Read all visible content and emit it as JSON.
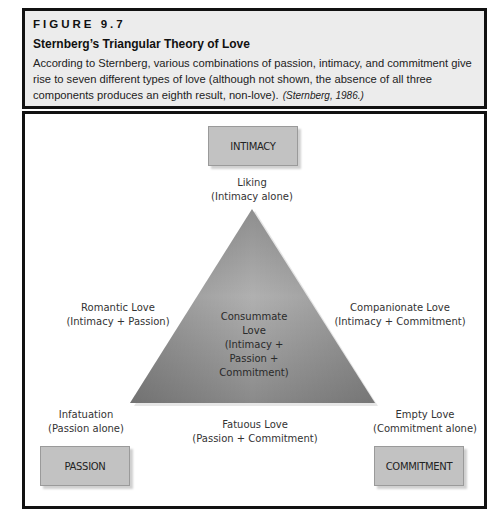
{
  "figure": {
    "label": "FIGURE 9.7",
    "title": "Sternberg’s Triangular Theory of Love",
    "caption": "According to Sternberg, various combinations of passion, intimacy, and commitment give rise to seven different types of love (although not shown, the absence of all three components produces an eighth result, non-love).",
    "citation": "(Sternberg, 1986.)"
  },
  "diagram": {
    "components": {
      "top": "INTIMACY",
      "bottom_left": "PASSION",
      "bottom_right": "COMMITMENT"
    },
    "vertex_labels": {
      "top": {
        "name": "Liking",
        "detail": "(Intimacy alone)"
      },
      "bottom_left": {
        "name": "Infatuation",
        "detail": "(Passion alone)"
      },
      "bottom_right": {
        "name": "Empty Love",
        "detail": "(Commitment alone)"
      }
    },
    "edge_labels": {
      "left": {
        "name": "Romantic Love",
        "detail": "(Intimacy + Passion)"
      },
      "right": {
        "name": "Companionate Love",
        "detail": "(Intimacy + Commitment)"
      },
      "bottom": {
        "name": "Fatuous Love",
        "detail": "(Passion + Commitment)"
      }
    },
    "center": {
      "lines": [
        "Consummate",
        "Love",
        "(Intimacy +",
        "Passion +",
        "Commitment)"
      ]
    },
    "colors": {
      "triangle_light": "#b8b8b8",
      "triangle_dark": "#7a7a7a",
      "box_fill": "#c2c2c2",
      "header_bg": "#ececec"
    }
  }
}
